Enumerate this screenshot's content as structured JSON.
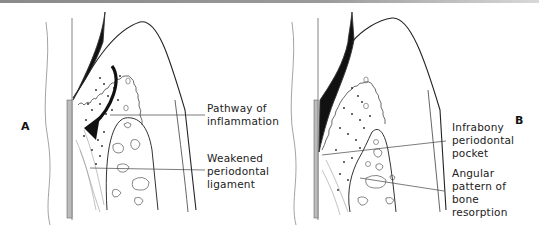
{
  "figure": {
    "panels": [
      {
        "id": "A",
        "letter": "A",
        "labels": [
          {
            "id": "pathway",
            "lines": [
              "Pathway of",
              "inflammation"
            ]
          },
          {
            "id": "pdl",
            "lines": [
              "Weakened",
              "periodontal",
              "ligament"
            ]
          }
        ]
      },
      {
        "id": "B",
        "letter": "B",
        "labels": [
          {
            "id": "pocket",
            "lines": [
              "Infrabony",
              "periodontal",
              "pocket"
            ]
          },
          {
            "id": "resorption",
            "lines": [
              "Angular",
              "pattern of",
              "bone",
              "resorption"
            ]
          }
        ]
      }
    ],
    "colors": {
      "line": "#222222",
      "fill": "#111111",
      "background": "#ffffff",
      "top_border": "#8a8a8a"
    }
  }
}
